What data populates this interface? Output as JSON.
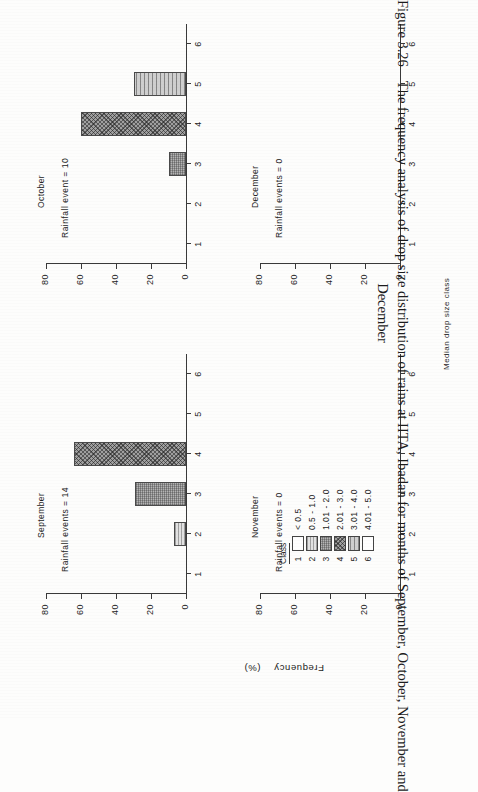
{
  "caption": {
    "number": "Figure 3.26",
    "line1": "The frequency analysis of drop size distribution of rains at IITA, Ibadan for months of September, October, November and",
    "line2": "December"
  },
  "axes": {
    "y_title": "Frequency",
    "y_unit": "(%)",
    "x_title": "Median drop size class",
    "y_ticks": [
      "80",
      "60",
      "40",
      "20",
      "0"
    ],
    "x_ticks": [
      "1",
      "2",
      "3",
      "4",
      "5",
      "6"
    ]
  },
  "legend": {
    "header": "Class",
    "rows": [
      {
        "num": "1",
        "range": "< 0.5",
        "fill": "fill-1"
      },
      {
        "num": "2",
        "range": "0.5 - 1.0",
        "fill": "fill-2"
      },
      {
        "num": "3",
        "range": "1.01 - 2.0",
        "fill": "fill-3"
      },
      {
        "num": "4",
        "range": "2.01 - 3.0",
        "fill": "fill-4"
      },
      {
        "num": "5",
        "range": "3.01 - 4.0",
        "fill": "fill-5"
      },
      {
        "num": "6",
        "range": "4.01 - 5.0",
        "fill": "fill-6"
      }
    ]
  },
  "panels": {
    "september": {
      "title": "September",
      "events": "Rainfall  events  =  14"
    },
    "october": {
      "title": "October",
      "events": "Rainfall  event  =  10"
    },
    "november": {
      "title": "November",
      "events": "Rainfall  events  =  0"
    },
    "december": {
      "title": "December",
      "events": "Rainfall  events  =  0"
    }
  },
  "chart_data": [
    {
      "type": "bar",
      "title": "September",
      "annotation": "Rainfall  events  =  14",
      "categories": [
        "1",
        "2",
        "3",
        "4",
        "5",
        "6"
      ],
      "values": [
        0,
        7,
        29,
        64,
        0,
        0
      ],
      "xlabel": "Median drop size class",
      "ylabel": "Frequency (%)",
      "ylim": [
        0,
        80
      ],
      "yticks": [
        0,
        20,
        40,
        60,
        80
      ],
      "grid": false,
      "bar_fills": [
        "fill-1",
        "fill-2",
        "fill-3",
        "fill-4",
        "fill-5",
        "fill-6"
      ]
    },
    {
      "type": "bar",
      "title": "October",
      "annotation": "Rainfall  event  =  10",
      "categories": [
        "1",
        "2",
        "3",
        "4",
        "5",
        "6"
      ],
      "values": [
        0,
        0,
        10,
        60,
        30,
        0
      ],
      "xlabel": "Median drop size class",
      "ylabel": "Frequency (%)",
      "ylim": [
        0,
        80
      ],
      "yticks": [
        0,
        20,
        40,
        60,
        80
      ],
      "grid": false,
      "bar_fills": [
        "fill-1",
        "fill-2",
        "fill-3",
        "fill-4",
        "fill-5",
        "fill-6"
      ]
    },
    {
      "type": "bar",
      "title": "November",
      "annotation": "Rainfall  events  =  0",
      "categories": [
        "1",
        "2",
        "3",
        "4",
        "5",
        "6"
      ],
      "values": [
        0,
        0,
        0,
        0,
        0,
        0
      ],
      "xlabel": "Median drop size class",
      "ylabel": "Frequency (%)",
      "ylim": [
        0,
        80
      ],
      "yticks": [
        0,
        20,
        40,
        60,
        80
      ],
      "grid": false,
      "bar_fills": [
        "fill-1",
        "fill-2",
        "fill-3",
        "fill-4",
        "fill-5",
        "fill-6"
      ]
    },
    {
      "type": "bar",
      "title": "December",
      "annotation": "Rainfall  events  =  0",
      "categories": [
        "1",
        "2",
        "3",
        "4",
        "5",
        "6"
      ],
      "values": [
        0,
        0,
        0,
        0,
        0,
        0
      ],
      "xlabel": "Median drop size class",
      "ylabel": "Frequency (%)",
      "ylim": [
        0,
        80
      ],
      "yticks": [
        0,
        20,
        40,
        60,
        80
      ],
      "grid": false,
      "bar_fills": [
        "fill-1",
        "fill-2",
        "fill-3",
        "fill-4",
        "fill-5",
        "fill-6"
      ]
    }
  ]
}
